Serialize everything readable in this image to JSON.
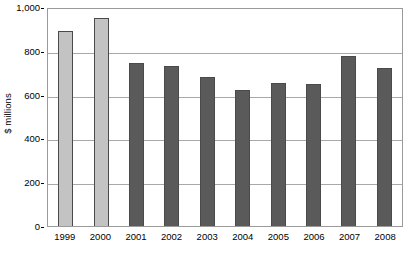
{
  "chart_data": {
    "type": "bar",
    "title": "",
    "subtitle": "",
    "xlabel": "",
    "ylabel": "$ millions",
    "categories": [
      "1999",
      "2000",
      "2001",
      "2002",
      "2003",
      "2004",
      "2005",
      "2006",
      "2007",
      "2008"
    ],
    "values": [
      890,
      950,
      745,
      730,
      680,
      620,
      655,
      650,
      775,
      720
    ],
    "series": [
      {
        "name": "Annual amount",
        "values": [
          890,
          950,
          745,
          730,
          680,
          620,
          655,
          650,
          775,
          720
        ]
      }
    ],
    "bar_colors": [
      "#c3c3c3",
      "#c3c3c3",
      "#5a5a5a",
      "#5a5a5a",
      "#5a5a5a",
      "#5a5a5a",
      "#5a5a5a",
      "#5a5a5a",
      "#5a5a5a",
      "#5a5a5a"
    ],
    "bar_border_color": "#4a4a4a",
    "light_bar_color": "#c3c3c3",
    "dark_bar_color": "#5a5a5a",
    "ylim": [
      0,
      1000
    ],
    "ytick_values": [
      0,
      200,
      400,
      600,
      800,
      1000
    ],
    "ytick_labels": [
      "0",
      "200",
      "400",
      "600",
      "800",
      "1,000"
    ],
    "grid": true,
    "grid_axis": "y",
    "grid_color": "#a8a8a8",
    "legend": false,
    "legend_position": "none",
    "plot_border_color": "#9a9a9a",
    "background_color": "#ffffff",
    "annotations": []
  }
}
